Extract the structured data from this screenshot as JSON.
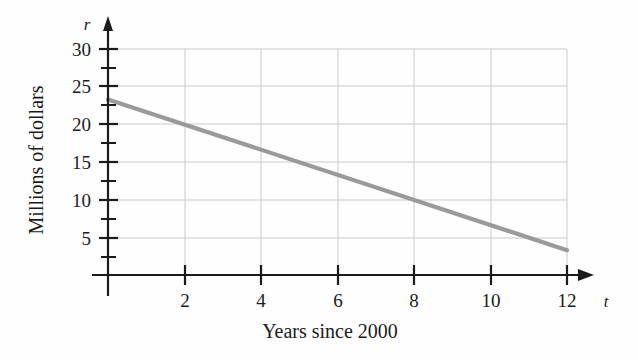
{
  "chart_data": {
    "type": "line",
    "title": "",
    "subtitle": "",
    "xlabel": "Years since 2000",
    "ylabel": "Millions of dollars",
    "x_axis_variable": "t",
    "y_axis_variable": "r",
    "xlim": [
      0,
      12.9
    ],
    "ylim": [
      0,
      32
    ],
    "grid": true,
    "legend": "none",
    "x_ticks_major": [
      2,
      4,
      6,
      8,
      10,
      12
    ],
    "x_tick_labels": [
      "2",
      "4",
      "6",
      "8",
      "10",
      "12"
    ],
    "y_ticks_major": [
      5,
      10,
      15,
      20,
      25,
      30
    ],
    "y_tick_labels": [
      "5",
      "10",
      "15",
      "20",
      "25",
      "30"
    ],
    "y_ticks_minor": [
      2.5,
      7.5,
      12.5,
      17.5,
      22.5,
      27.5
    ],
    "series": [
      {
        "name": "revenue",
        "color": "#9a9a9a",
        "x": [
          0,
          2,
          4,
          6,
          8,
          10,
          12
        ],
        "values": [
          23.3,
          20.0,
          16.7,
          13.3,
          10.0,
          6.7,
          3.3
        ],
        "slope": -1.67,
        "intercept": 23.3
      }
    ],
    "annotations": []
  },
  "figure": {
    "axis_color": "#1b1b1b",
    "grid_color": "#c9c9c9",
    "line_color": "#9a9a9a",
    "background": "#fefefe"
  }
}
